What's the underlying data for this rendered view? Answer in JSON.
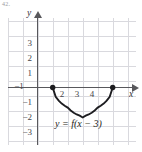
{
  "figure": {
    "corner_mark": "42.",
    "equation_label": "y = f(x − 3)",
    "x_axis_name": "x",
    "y_axis_name": "y",
    "accent_color": "#1d1d20",
    "grid_color": "#d9d9de",
    "axis_color": "#58585c"
  },
  "ticks": {
    "x": [
      {
        "label": "−1",
        "value": -1
      },
      {
        "label": "2",
        "value": 2
      },
      {
        "label": "3",
        "value": 3
      },
      {
        "label": "4",
        "value": 4
      }
    ],
    "y": [
      {
        "label": "3",
        "value": 3
      },
      {
        "label": "2",
        "value": 2
      },
      {
        "label": "1",
        "value": 1
      },
      {
        "label": "−1",
        "value": -1
      },
      {
        "label": "−2",
        "value": -2
      },
      {
        "label": "−3",
        "value": -3
      }
    ]
  },
  "chart_data": {
    "type": "line",
    "title": "",
    "subtitle": "",
    "xlabel": "x",
    "ylabel": "y",
    "xlim": [
      -2,
      6.4
    ],
    "ylim": [
      -3.6,
      4.7
    ],
    "grid": true,
    "grid_spacing": 1,
    "legend": "none",
    "annotations": [
      {
        "text": "y = f(x − 3)",
        "x": 3.0,
        "y": -2.9
      }
    ],
    "series": [
      {
        "name": "y = f(x - 3)",
        "description": "Lower semicircle arc with endpoints (1,0) and (5,0) and minimum (3,-2)",
        "style": "solid",
        "color": "#1d1d20",
        "endpoints_filled": true,
        "x": [
          1.0,
          1.2,
          1.4,
          1.6,
          1.8,
          2.0,
          2.2,
          2.4,
          2.6,
          2.8,
          3.0,
          3.2,
          3.4,
          3.6,
          3.8,
          4.0,
          4.2,
          4.4,
          4.6,
          4.8,
          5.0
        ],
        "y": [
          0.0,
          -0.62,
          -0.87,
          -1.07,
          -1.22,
          -1.34,
          -1.53,
          -1.68,
          -1.8,
          -1.88,
          -2.0,
          -1.88,
          -1.8,
          -1.68,
          -1.53,
          -1.34,
          -1.22,
          -1.07,
          -0.87,
          -0.62,
          0.0
        ]
      }
    ],
    "points": [
      {
        "x": 1,
        "y": 0,
        "marker": "filled-circle"
      },
      {
        "x": 5,
        "y": 0,
        "marker": "filled-circle"
      }
    ]
  }
}
